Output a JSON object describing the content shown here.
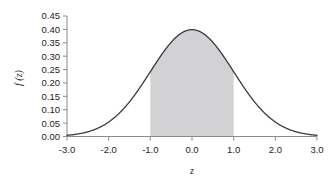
{
  "chart_data": {
    "type": "line",
    "title": "",
    "subtitle": "",
    "xlabel": "z",
    "ylabel": "f (z)",
    "xlim": [
      -3.0,
      3.0
    ],
    "ylim": [
      0.0,
      0.45
    ],
    "grid": false,
    "legend": null,
    "curve_color": "#3a3a3c",
    "fill_color": "#d2d2d4",
    "axis_color": "#8a8a8f",
    "background_color": "#ffffff",
    "x_ticks": [
      "-3.0",
      "-2.0",
      "-1.0",
      "0.0",
      "1.0",
      "2.0",
      "3.0"
    ],
    "x_tick_values": [
      -3.0,
      -2.0,
      -1.0,
      0.0,
      1.0,
      2.0,
      3.0
    ],
    "y_ticks": [
      "0.00",
      "0.05",
      "0.10",
      "0.15",
      "0.20",
      "0.25",
      "0.30",
      "0.35",
      "0.40",
      "0.45"
    ],
    "y_tick_values": [
      0.0,
      0.05,
      0.1,
      0.15,
      0.2,
      0.25,
      0.3,
      0.35,
      0.4,
      0.45
    ],
    "series": [
      {
        "name": "standard normal density",
        "x": [
          -3.0,
          -2.8,
          -2.6,
          -2.4,
          -2.2,
          -2.0,
          -1.8,
          -1.6,
          -1.4,
          -1.2,
          -1.0,
          -0.8,
          -0.6,
          -0.4,
          -0.2,
          0.0,
          0.2,
          0.4,
          0.6,
          0.8,
          1.0,
          1.2,
          1.4,
          1.6,
          1.8,
          2.0,
          2.2,
          2.4,
          2.6,
          2.8,
          3.0
        ],
        "values": [
          0.0044,
          0.0079,
          0.0136,
          0.0224,
          0.0355,
          0.054,
          0.079,
          0.1109,
          0.1497,
          0.1942,
          0.242,
          0.2897,
          0.3332,
          0.3683,
          0.391,
          0.3989,
          0.391,
          0.3683,
          0.3332,
          0.2897,
          0.242,
          0.1942,
          0.1497,
          0.1109,
          0.079,
          0.054,
          0.0355,
          0.0224,
          0.0136,
          0.0079,
          0.0044
        ]
      }
    ],
    "shaded_region": {
      "label": "",
      "x_start": -1.0,
      "x_end": 1.0,
      "color": "#d2d2d4"
    },
    "annotations": []
  }
}
